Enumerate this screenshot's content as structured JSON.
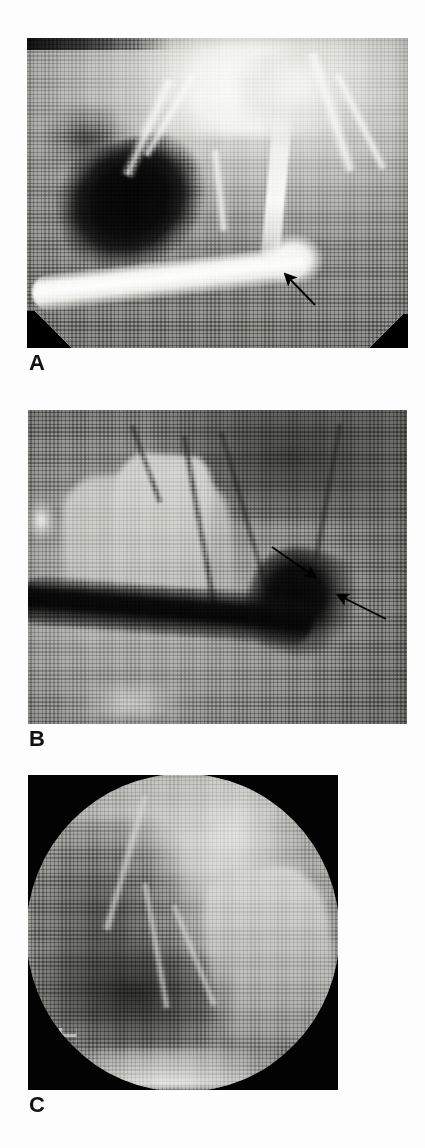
{
  "figure": {
    "type": "radiographic-figure-plate",
    "panel_count": 3,
    "background_color": "#ffffff"
  },
  "panels": [
    {
      "id": "A",
      "label": "A",
      "modality": "fluoroscopic contrast radiograph",
      "frame": {
        "x": 27,
        "y": 38,
        "width": 381,
        "height": 310
      },
      "label_position": {
        "x": 30,
        "y": 352
      },
      "border_color": "#000000",
      "corner_masks": [
        "bottom-left",
        "bottom-right"
      ],
      "arrows": [
        {
          "name": "arrow-a1",
          "direction": "up-left",
          "angle_deg": 225,
          "tip": {
            "x": 283,
            "y": 272
          },
          "tail": {
            "x": 312,
            "y": 303
          },
          "color": "#000000",
          "note": "points to contrast-filled structure"
        }
      ]
    },
    {
      "id": "B",
      "label": "B",
      "modality": "fluoroscopic contrast radiograph",
      "frame": {
        "x": 28,
        "y": 410,
        "width": 379,
        "height": 314
      },
      "label_position": {
        "x": 30,
        "y": 728
      },
      "border_color": "#000000",
      "corner_masks": [],
      "arrows": [
        {
          "name": "arrow-b1",
          "direction": "down-right-to-left",
          "angle_deg": 200,
          "tip": {
            "x": 316,
            "y": 578
          },
          "tail": {
            "x": 274,
            "y": 549
          },
          "color": "#000000",
          "note": "upper arrow"
        },
        {
          "name": "arrow-b2",
          "direction": "up-left",
          "angle_deg": 200,
          "tip": {
            "x": 337,
            "y": 595
          },
          "tail": {
            "x": 383,
            "y": 620
          },
          "color": "#000000",
          "note": "lower arrow"
        }
      ]
    },
    {
      "id": "C",
      "label": "C",
      "modality": "fluoroscopic spot image (circular field of view)",
      "frame": {
        "x": 28,
        "y": 775,
        "width": 310,
        "height": 315
      },
      "label_position": {
        "x": 30,
        "y": 1094
      },
      "border_color": "#000000",
      "field_shape": "circle",
      "corner_masks": [
        "top-left",
        "top-right",
        "bottom-left",
        "bottom-right"
      ],
      "arrows": [],
      "overlay_marks": "small illegible fluoroscopy display characters at lower left of field"
    }
  ],
  "colors": {
    "page_background": "#ffffff",
    "panel_border": "#000000",
    "label_text": "#111111",
    "arrow": "#000000",
    "panel_a_midtone": "#8a8a87",
    "panel_b_midtone": "#6f6f6c",
    "panel_c_midtone": "#a9a9a6"
  },
  "typography": {
    "label_weight": "bold",
    "label_size_px": 22
  }
}
